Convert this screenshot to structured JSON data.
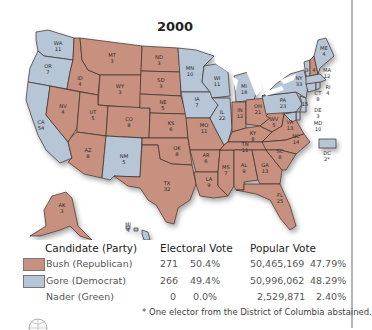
{
  "title": "2000",
  "colors": {
    "republican": "#c8917f",
    "democrat": "#b7c6d6",
    "lakes": "#ffffff",
    "border": "#3b2c28"
  },
  "states": [
    {
      "abbr": "WA",
      "ev": "11",
      "party": "democrat"
    },
    {
      "abbr": "OR",
      "ev": "7",
      "party": "democrat"
    },
    {
      "abbr": "CA",
      "ev": "54",
      "party": "democrat"
    },
    {
      "abbr": "ID",
      "ev": "4",
      "party": "republican"
    },
    {
      "abbr": "NV",
      "ev": "4",
      "party": "republican"
    },
    {
      "abbr": "MT",
      "ev": "3",
      "party": "republican"
    },
    {
      "abbr": "WY",
      "ev": "3",
      "party": "republican"
    },
    {
      "abbr": "UT",
      "ev": "5",
      "party": "republican"
    },
    {
      "abbr": "AZ",
      "ev": "8",
      "party": "republican"
    },
    {
      "abbr": "CO",
      "ev": "8",
      "party": "republican"
    },
    {
      "abbr": "NM",
      "ev": "5",
      "party": "democrat"
    },
    {
      "abbr": "ND",
      "ev": "3",
      "party": "republican"
    },
    {
      "abbr": "SD",
      "ev": "3",
      "party": "republican"
    },
    {
      "abbr": "NE",
      "ev": "5",
      "party": "republican"
    },
    {
      "abbr": "KS",
      "ev": "6",
      "party": "republican"
    },
    {
      "abbr": "OK",
      "ev": "8",
      "party": "republican"
    },
    {
      "abbr": "TX",
      "ev": "32",
      "party": "republican"
    },
    {
      "abbr": "MN",
      "ev": "10",
      "party": "democrat"
    },
    {
      "abbr": "IA",
      "ev": "7",
      "party": "democrat"
    },
    {
      "abbr": "MO",
      "ev": "11",
      "party": "republican"
    },
    {
      "abbr": "AR",
      "ev": "6",
      "party": "republican"
    },
    {
      "abbr": "LA",
      "ev": "9",
      "party": "republican"
    },
    {
      "abbr": "WI",
      "ev": "11",
      "party": "democrat"
    },
    {
      "abbr": "IL",
      "ev": "22",
      "party": "democrat"
    },
    {
      "abbr": "MS",
      "ev": "7",
      "party": "republican"
    },
    {
      "abbr": "MI",
      "ev": "18",
      "party": "democrat"
    },
    {
      "abbr": "IN",
      "ev": "12",
      "party": "republican"
    },
    {
      "abbr": "KY",
      "ev": "8",
      "party": "republican"
    },
    {
      "abbr": "TN",
      "ev": "11",
      "party": "republican"
    },
    {
      "abbr": "AL",
      "ev": "9",
      "party": "republican"
    },
    {
      "abbr": "OH",
      "ev": "21",
      "party": "republican"
    },
    {
      "abbr": "GA",
      "ev": "13",
      "party": "republican"
    },
    {
      "abbr": "FL",
      "ev": "25",
      "party": "republican"
    },
    {
      "abbr": "WV",
      "ev": "5",
      "party": "republican"
    },
    {
      "abbr": "VA",
      "ev": "13",
      "party": "republican"
    },
    {
      "abbr": "NC",
      "ev": "14",
      "party": "republican"
    },
    {
      "abbr": "SC",
      "ev": "8",
      "party": "republican"
    },
    {
      "abbr": "PA",
      "ev": "23",
      "party": "democrat"
    },
    {
      "abbr": "NY",
      "ev": "33",
      "party": "democrat"
    },
    {
      "abbr": "VT",
      "ev": "3",
      "party": "democrat"
    },
    {
      "abbr": "NH",
      "ev": "4",
      "party": "republican"
    },
    {
      "abbr": "ME",
      "ev": "4",
      "party": "democrat"
    },
    {
      "abbr": "MA",
      "ev": "12",
      "party": "democrat"
    },
    {
      "abbr": "RI",
      "ev": "4",
      "party": "democrat"
    },
    {
      "abbr": "CT",
      "ev": "8",
      "party": "democrat"
    },
    {
      "abbr": "NJ",
      "ev": "15",
      "party": "democrat"
    },
    {
      "abbr": "DE",
      "ev": "3",
      "party": "democrat"
    },
    {
      "abbr": "MD",
      "ev": "10",
      "party": "democrat"
    },
    {
      "abbr": "DC",
      "ev": "2*",
      "party": "democrat"
    },
    {
      "abbr": "AK",
      "ev": "3",
      "party": "republican"
    },
    {
      "abbr": "HI",
      "ev": "4",
      "party": "democrat"
    }
  ],
  "labels": {
    "WA": "WA",
    "WA_ev": "11",
    "OR": "OR",
    "OR_ev": "7",
    "CA": "CA",
    "CA_ev": "54",
    "ID": "ID",
    "ID_ev": "4",
    "NV": "NV",
    "NV_ev": "4",
    "MT": "MT",
    "MT_ev": "3",
    "WY": "WY",
    "WY_ev": "3",
    "UT": "UT",
    "UT_ev": "5",
    "AZ": "AZ",
    "AZ_ev": "8",
    "CO": "CO",
    "CO_ev": "8",
    "NM": "NM",
    "NM_ev": "5",
    "ND": "ND",
    "ND_ev": "3",
    "SD": "SD",
    "SD_ev": "3",
    "NE": "NE",
    "NE_ev": "5",
    "KS": "KS",
    "KS_ev": "6",
    "OK": "OK",
    "OK_ev": "8",
    "TX": "TX",
    "TX_ev": "32",
    "MN": "MN",
    "MN_ev": "10",
    "IA": "IA",
    "IA_ev": "7",
    "MO": "MO",
    "MO_ev": "11",
    "AR": "AR",
    "AR_ev": "6",
    "LA": "LA",
    "LA_ev": "9",
    "WI": "WI",
    "WI_ev": "11",
    "IL": "IL",
    "IL_ev": "22",
    "MS": "MS",
    "MS_ev": "7",
    "MI": "MI",
    "MI_ev": "18",
    "IN": "IN",
    "IN_ev": "12",
    "KY": "KY",
    "KY_ev": "8",
    "TN": "TN",
    "TN_ev": "11",
    "AL": "AL",
    "AL_ev": "9",
    "OH": "OH",
    "OH_ev": "21",
    "GA": "GA",
    "GA_ev": "13",
    "FL": "FL",
    "FL_ev": "25",
    "WV": "WV",
    "WV_ev": "5",
    "VA": "VA",
    "VA_ev": "13",
    "NC": "NC",
    "NC_ev": "14",
    "SC": "SC",
    "SC_ev": "8",
    "PA": "PA",
    "PA_ev": "23",
    "NY": "NY",
    "NY_ev": "33",
    "VT_ev": "3",
    "NH_ev": "4",
    "ME": "ME",
    "ME_ev": "4",
    "MA": "MA",
    "MA_ev": "12",
    "RI": "RI",
    "RI_ev": "4",
    "CT": "CT",
    "CT_ev": "8",
    "NJ_ev": "15",
    "DE": "DE",
    "DE_ev": "3",
    "MD": "MD",
    "MD_ev": "10",
    "DC": "DC",
    "DC_ev": "2*",
    "AK": "AK",
    "AK_ev": "3",
    "HI": "HI",
    "HI_ev": "4"
  },
  "legend": {
    "headers": {
      "candidate": "Candidate (Party)",
      "electoral": "Electoral Vote",
      "popular": "Popular Vote"
    },
    "rows": [
      {
        "candidate": "Bush (Republican)",
        "ev": "271",
        "ev_pct": "50.4%",
        "pv": "50,465,169",
        "pv_pct": "47.79%",
        "swatch": "republican"
      },
      {
        "candidate": "Gore (Democrat)",
        "ev": "266",
        "ev_pct": "49.4%",
        "pv": "50,996,062",
        "pv_pct": "48.29%",
        "swatch": "democrat"
      },
      {
        "candidate": "Nader (Green)",
        "ev": "0",
        "ev_pct": "0.0%",
        "pv": "2,529,871",
        "pv_pct": "2.40%",
        "swatch": null
      }
    ],
    "footnote": "* One elector from the District of Columbia abstained."
  }
}
